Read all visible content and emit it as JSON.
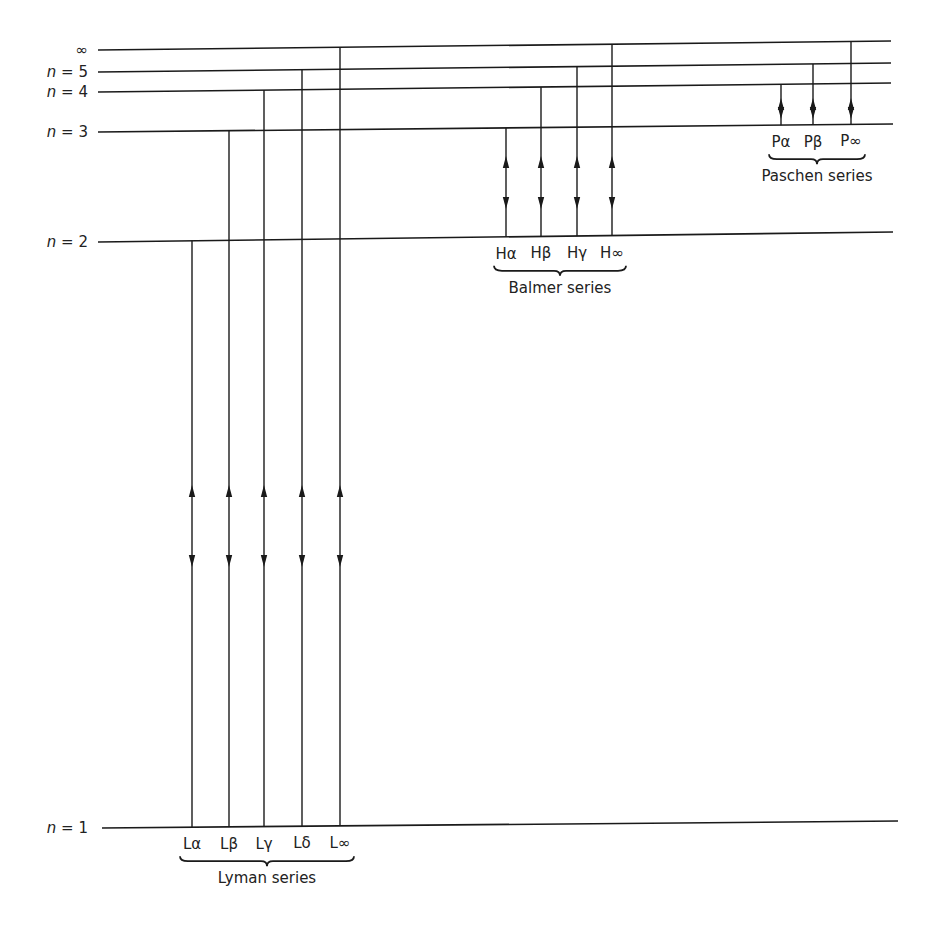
{
  "levels": [
    {
      "id": "inf",
      "label": "∞",
      "y_left": 50,
      "y_right": 41,
      "x1": 98,
      "x2": 891
    },
    {
      "id": "n5",
      "label_prefix": "n",
      "label": "= 5",
      "y_left": 72,
      "y_right": 63,
      "x1": 98,
      "x2": 891
    },
    {
      "id": "n4",
      "label_prefix": "n",
      "label": "= 4",
      "y_left": 92,
      "y_right": 83,
      "x1": 98,
      "x2": 891
    },
    {
      "id": "n3",
      "label_prefix": "n",
      "label": "= 3",
      "y_left": 132,
      "y_right": 124,
      "x1": 98,
      "x2": 893
    },
    {
      "id": "n2",
      "label_prefix": "n",
      "label": "= 2",
      "y_left": 242,
      "y_right": 232,
      "x1": 98,
      "x2": 893
    },
    {
      "id": "n1",
      "label_prefix": "n",
      "label": "= 1",
      "y_left": 828,
      "y_right": 821,
      "x1": 102,
      "x2": 898
    }
  ],
  "series": [
    {
      "name": "Lyman series",
      "lower_level": "n1",
      "lines": [
        {
          "label": "Lα",
          "upper": "n2",
          "x": 192
        },
        {
          "label": "Lβ",
          "upper": "n3",
          "x": 229
        },
        {
          "label": "Lγ",
          "upper": "n4",
          "x": 264
        },
        {
          "label": "Lδ",
          "upper": "n5",
          "x": 302
        },
        {
          "label": "L∞",
          "upper": "inf",
          "x": 340
        }
      ],
      "arrow_up_y": 492,
      "arrow_down_y": 560
    },
    {
      "name": "Balmer series",
      "lower_level": "n2",
      "lines": [
        {
          "label": "Hα",
          "upper": "n3",
          "x": 506
        },
        {
          "label": "Hβ",
          "upper": "n4",
          "x": 541
        },
        {
          "label": "Hγ",
          "upper": "n5",
          "x": 577
        },
        {
          "label": "H∞",
          "upper": "inf",
          "x": 612
        }
      ],
      "arrow_up_y": 163,
      "arrow_down_y": 202
    },
    {
      "name": "Paschen series",
      "lower_level": "n3",
      "lines": [
        {
          "label": "Pα",
          "upper": "n4",
          "x": 781
        },
        {
          "label": "Pβ",
          "upper": "n5",
          "x": 813
        },
        {
          "label": "P∞",
          "upper": "inf",
          "x": 851
        }
      ],
      "arrow_up_y": 105,
      "arrow_down_y": 112
    }
  ],
  "colors": {
    "ink": "#1a1a1a",
    "background": "#ffffff"
  }
}
